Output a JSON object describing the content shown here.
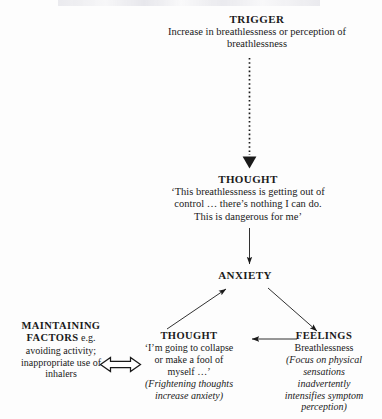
{
  "figure": {
    "width": 382,
    "height": 419,
    "background": "#fdfdfd",
    "ink": "#1a1a1a"
  },
  "nodes": {
    "trigger": {
      "heading": "TRIGGER",
      "body_line1": "Increase in breathlessness or perception of",
      "body_line2": "breathlessness"
    },
    "thought_top": {
      "heading": "THOUGHT",
      "body_line1": "‘This breathlessness is getting out of",
      "body_line2": "control … there’s nothing I can do.",
      "body_line3": "This is dangerous for me’"
    },
    "anxiety": {
      "heading": "ANXIETY"
    },
    "maintaining_factors": {
      "heading": "MAINTAINING",
      "heading_line2": "FACTORS",
      "heading_suffix": " e.g.",
      "body_line1": "avoiding activity;",
      "body_line2": "inappropriate use of",
      "body_line3": "inhalers"
    },
    "thought_bottom": {
      "heading": "THOUGHT",
      "body_line1": "‘I’m going to collapse",
      "body_line2": "or make a fool of",
      "body_line3": "myself …’",
      "italic_line1": "(Frightening thoughts",
      "italic_line2": "increase anxiety)"
    },
    "feelings": {
      "heading": "FEELINGS",
      "body_line1": "Breathlessness",
      "italic_line1": "(Focus on physical",
      "italic_line2": "sensations",
      "italic_line3": "inadvertently",
      "italic_line4": "intensifies symptom",
      "italic_line5": "perception)"
    }
  },
  "connectors": [
    {
      "name": "trigger-to-thought",
      "style": "dotted",
      "direction": "down",
      "from": "trigger",
      "to": "thought_top"
    },
    {
      "name": "thought-to-anxiety",
      "style": "solid",
      "direction": "down",
      "from": "thought_top",
      "to": "anxiety"
    },
    {
      "name": "thought-bottom-to-anxiety",
      "style": "solid",
      "direction": "up-right",
      "from": "thought_bottom",
      "to": "anxiety"
    },
    {
      "name": "anxiety-to-feelings",
      "style": "solid",
      "direction": "down-right",
      "from": "anxiety",
      "to": "feelings"
    },
    {
      "name": "feelings-to-thought-bottom",
      "style": "solid",
      "direction": "left",
      "from": "feelings",
      "to": "thought_bottom"
    },
    {
      "name": "maintaining-thought-bidirectional",
      "style": "hollow-double",
      "direction": "both",
      "from": "maintaining_factors",
      "to": "thought_bottom"
    }
  ]
}
